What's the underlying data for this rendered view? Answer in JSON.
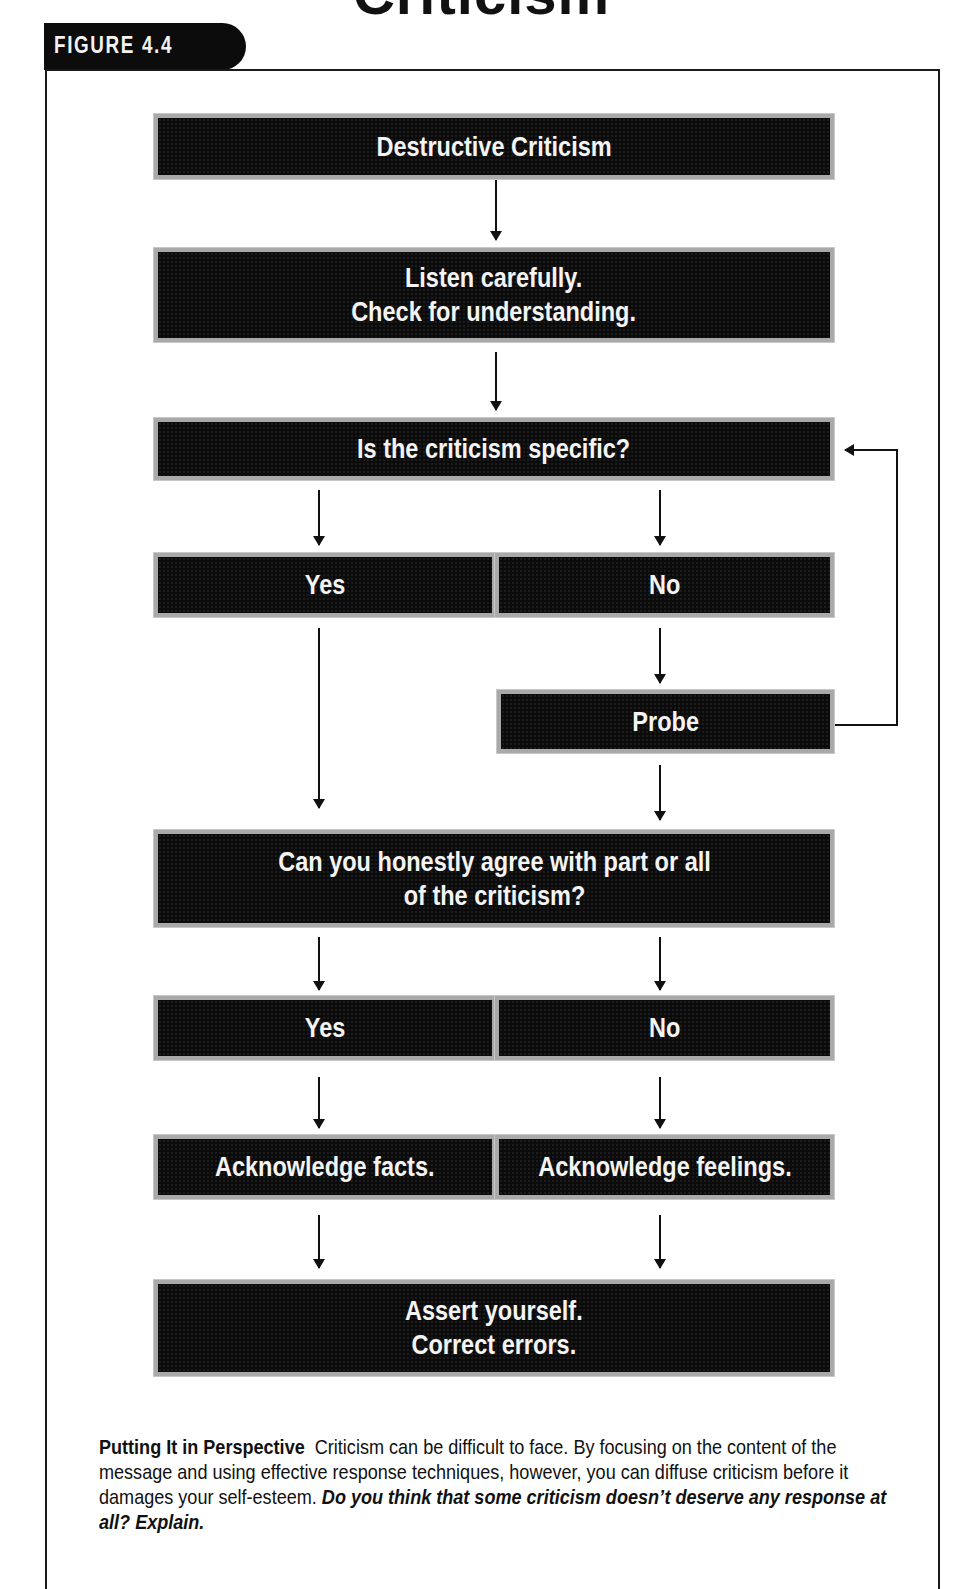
{
  "page_title_partial": "Criticism",
  "figure_label": "FIGURE 4.4",
  "flowchart": {
    "nodes": [
      {
        "id": "destructive",
        "label": "Destructive Criticism"
      },
      {
        "id": "listen",
        "label": "Listen carefully.\nCheck for understanding."
      },
      {
        "id": "specific_q",
        "label": "Is the criticism specific?"
      },
      {
        "id": "specific_yes",
        "label": "Yes"
      },
      {
        "id": "specific_no",
        "label": "No"
      },
      {
        "id": "probe",
        "label": "Probe"
      },
      {
        "id": "agree_q",
        "label": "Can you honestly agree with part or all\nof the criticism?"
      },
      {
        "id": "agree_yes",
        "label": "Yes"
      },
      {
        "id": "agree_no",
        "label": "No"
      },
      {
        "id": "ack_facts",
        "label": "Acknowledge facts."
      },
      {
        "id": "ack_feelings",
        "label": "Acknowledge feelings."
      },
      {
        "id": "assert",
        "label": "Assert yourself.\nCorrect errors."
      }
    ],
    "edges": [
      {
        "from": "destructive",
        "to": "listen"
      },
      {
        "from": "listen",
        "to": "specific_q"
      },
      {
        "from": "specific_q",
        "to": "specific_yes"
      },
      {
        "from": "specific_q",
        "to": "specific_no"
      },
      {
        "from": "specific_no",
        "to": "probe"
      },
      {
        "from": "probe",
        "to": "specific_q"
      },
      {
        "from": "specific_yes",
        "to": "agree_q"
      },
      {
        "from": "probe",
        "to": "agree_q"
      },
      {
        "from": "agree_q",
        "to": "agree_yes"
      },
      {
        "from": "agree_q",
        "to": "agree_no"
      },
      {
        "from": "agree_yes",
        "to": "ack_facts"
      },
      {
        "from": "agree_no",
        "to": "ack_feelings"
      },
      {
        "from": "ack_facts",
        "to": "assert"
      },
      {
        "from": "ack_feelings",
        "to": "assert"
      }
    ]
  },
  "caption": {
    "heading": "Putting It in Perspective",
    "body": "Criticism can be difficult to face. By focusing on the content of the message and using effective response techniques, however, you can diffuse criticism before it damages your self-esteem.",
    "question": "Do you think that some criticism doesn’t deserve any response at all? Explain."
  }
}
